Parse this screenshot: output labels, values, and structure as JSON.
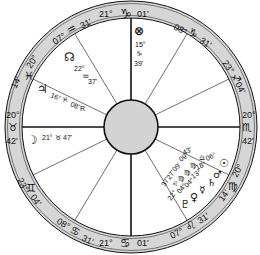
{
  "chart": {
    "center": [
      131,
      127
    ],
    "outer_radius": 126,
    "ring_inner_radius": 109,
    "hub_radius": 27,
    "colors": {
      "ring_fill": "#d6d6d6",
      "hub_fill": "#d3d3d3",
      "stroke": "#111111",
      "background": "#ffffff"
    }
  },
  "angles": {
    "mc": {
      "deg": "21°",
      "sign_glyph": "♑",
      "sign": "Capricorn",
      "min": "01'"
    },
    "ic": {
      "deg": "21°",
      "sign_glyph": "♋",
      "sign": "Cancer",
      "min": "01'"
    },
    "asc": {
      "deg": "20°",
      "sign_glyph": "♉",
      "sign": "Taurus",
      "min": "42'"
    },
    "dsc": {
      "deg": "20°",
      "sign_glyph": "♏",
      "sign": "Scorpio",
      "min": "42'"
    }
  },
  "cusps": [
    {
      "id": "c11",
      "deg": "08°",
      "sign_glyph": "♑",
      "sign": "Capricorn",
      "min": "31'"
    },
    {
      "id": "c12",
      "deg": "23°",
      "sign_glyph": "♐",
      "sign": "Sagittarius",
      "min": "04'"
    },
    {
      "id": "c9",
      "deg": "07°",
      "sign_glyph": "♒",
      "sign": "Aquarius",
      "min": "31'"
    },
    {
      "id": "c8",
      "deg": "20°",
      "sign_glyph": "♓",
      "sign": "Pisces",
      "min": "14'"
    },
    {
      "id": "c6",
      "deg": "23°",
      "sign_glyph": "♊",
      "sign": "Gemini",
      "min": "04'"
    },
    {
      "id": "c5",
      "deg": "08°",
      "sign_glyph": "♋",
      "sign": "Cancer",
      "min": "31'"
    },
    {
      "id": "c3",
      "deg": "07°",
      "sign_glyph": "♌",
      "sign": "Leo",
      "min": "31'"
    },
    {
      "id": "c2",
      "deg": "20°",
      "sign_glyph": "♍",
      "sign": "Virgo",
      "min": "14'"
    }
  ],
  "planets": [
    {
      "name": "Part of Fortune",
      "glyph": "⊗",
      "deg": "15°",
      "sign_glyph": "♑",
      "min": "39'"
    },
    {
      "name": "North Node",
      "glyph": "☊",
      "deg": "22°",
      "sign_glyph": "♒",
      "min": "37'"
    },
    {
      "name": "Jupiter",
      "glyph": "♃",
      "deg": "16°",
      "sign_glyph": "♓",
      "min": "08'",
      "retro": "R"
    },
    {
      "name": "Moon",
      "glyph": "☽",
      "deg": "21°",
      "sign_glyph": "♉",
      "min": "47'"
    },
    {
      "name": "Sun",
      "glyph": "☉",
      "deg": "06°",
      "sign_glyph": "♎",
      "min": "43'"
    },
    {
      "name": "Mars",
      "glyph": "♂",
      "deg": "18°",
      "sign_glyph": "♍",
      "min": "09'"
    },
    {
      "name": "Saturn",
      "glyph": "♄",
      "deg": "13°",
      "sign_glyph": "♍",
      "min": "09'"
    },
    {
      "name": "Mercury",
      "glyph": "☿",
      "deg": "04°",
      "sign_glyph": "♍",
      "min": "27'"
    },
    {
      "name": "Venus",
      "glyph": "♀",
      "deg": "04°",
      "sign_glyph": "♌",
      "min": "37'"
    },
    {
      "name": "Pluto",
      "glyph": "♇",
      "deg": "22°",
      "sign_glyph": "♌",
      "min": ""
    }
  ]
}
